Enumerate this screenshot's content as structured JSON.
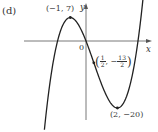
{
  "panel_label": "(d)",
  "axes": {
    "x_label": "x",
    "y_label": "y",
    "origin_label": "0"
  },
  "points": {
    "local_max": {
      "label": "(−1, 7)",
      "x": -1,
      "y": 7
    },
    "inflection": {
      "label_open": "(",
      "x_num": "1",
      "x_den": "2",
      "sep": ", −",
      "y_num": "13",
      "y_den": "2",
      "label_close": ")",
      "x": 0.5,
      "y": -6.5
    },
    "local_min": {
      "label": "(2, −20)",
      "x": 2,
      "y": -20
    }
  },
  "chart_data": {
    "type": "line",
    "title": "(d)",
    "xlabel": "x",
    "ylabel": "y",
    "function": "y = 2x^3 - 3x^2 - 12x",
    "annotations": [
      {
        "text": "(−1, 7)",
        "x": -1,
        "y": 7,
        "kind": "local maximum"
      },
      {
        "text": "(1/2, −13/2)",
        "x": 0.5,
        "y": -6.5,
        "kind": "inflection point"
      },
      {
        "text": "(2, −20)",
        "x": 2,
        "y": -20,
        "kind": "local minimum"
      },
      {
        "text": "0",
        "x": 0,
        "y": 0,
        "kind": "origin"
      }
    ],
    "series": [
      {
        "name": "f(x)",
        "x": [
          -2.6,
          -2.0,
          -1.5,
          -1.0,
          -0.5,
          0.0,
          0.5,
          1.0,
          1.5,
          2.0,
          2.5,
          3.0,
          3.5,
          3.8
        ],
        "values": [
          -24.2,
          -4.0,
          3.0,
          7.0,
          4.5,
          0.0,
          -6.5,
          -13.0,
          -18.0,
          -20.0,
          -17.5,
          -9.0,
          5.25,
          19.5
        ]
      }
    ],
    "xlim": [
      -3.9,
      4.1
    ],
    "ylim": [
      -27,
      12
    ],
    "grid": false,
    "legend": null
  }
}
